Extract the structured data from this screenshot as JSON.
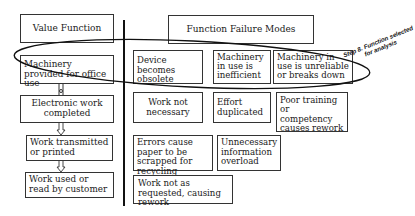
{
  "value_function": {
    "header": "Value Function",
    "steps": [
      "Machinery provided for office use",
      "Electronic work completed",
      "Work transmitted or printed",
      "Work used or read by customer"
    ]
  },
  "failure_modes": {
    "header": "Function Failure Modes",
    "items": [
      "Device becomes obsolete",
      "Machinery in use is inefficient",
      "Machinery in use is unreliable or breaks down",
      "Work not necessary",
      "Effort duplicated",
      "Poor training or competency causes rework",
      "Errors cause paper to be scrapped for recycling",
      "Unnecessary information overload",
      "Work not as requested, causing rework"
    ]
  },
  "annotation": {
    "line1": "Step 8. Function selected",
    "line2": "for analysis"
  }
}
